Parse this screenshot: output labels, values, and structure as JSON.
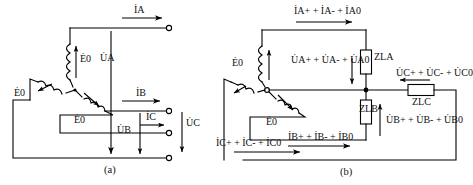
{
  "figure": {
    "type": "circuit-diagram",
    "captions": {
      "left": "(a)",
      "right": "(b)"
    }
  },
  "diagram_a": {
    "caption": "(a)",
    "source": {
      "type": "wye-connected-three-phase-source",
      "coil_count": 3,
      "emf_labels": [
        "Ė0",
        "Ė0",
        "Ė0"
      ]
    },
    "line_currents": [
      {
        "name": "current-a",
        "label": "İA",
        "direction": "right"
      },
      {
        "name": "current-b",
        "label": "İB",
        "direction": "right"
      },
      {
        "name": "current-c",
        "label": "İC",
        "direction": "right"
      }
    ],
    "phase_voltages": [
      {
        "name": "voltage-a",
        "label": "U̇A",
        "direction": "down"
      },
      {
        "name": "voltage-b",
        "label": "U̇B",
        "direction": "down"
      },
      {
        "name": "voltage-c",
        "label": "U̇C",
        "direction": "down"
      }
    ],
    "terminals": 3
  },
  "diagram_b": {
    "caption": "(b)",
    "source": {
      "type": "wye-connected-three-phase-source",
      "coil_count": 3,
      "emf_labels": [
        "Ė0",
        "Ė0",
        "Ė0"
      ]
    },
    "currents": [
      {
        "name": "current-a-components",
        "label": "İA+ + İA- + İA0",
        "direction": "right"
      },
      {
        "name": "current-b-components",
        "label": "İB+ + İB- + İB0",
        "direction": "right"
      },
      {
        "name": "current-c-components",
        "label": "İC+ + İC- + İC0",
        "direction": "right"
      }
    ],
    "voltages": [
      {
        "name": "voltage-a-components",
        "label": "U̇A+ + U̇A- + U̇A0",
        "direction": "down"
      },
      {
        "name": "voltage-b-components",
        "label": "U̇B+ + U̇B- + U̇B0",
        "direction": "up"
      },
      {
        "name": "voltage-c-components",
        "label": "U̇C+ + U̇C- + U̇C0",
        "direction": "left"
      }
    ],
    "impedances": [
      {
        "name": "impedance-la",
        "label": "ZLA",
        "orientation": "vertical"
      },
      {
        "name": "impedance-lb",
        "label": "ZLB",
        "orientation": "vertical"
      },
      {
        "name": "impedance-lc",
        "label": "ZLC",
        "orientation": "horizontal"
      }
    ]
  },
  "style": {
    "line_color": "#000000",
    "background": "#ffffff",
    "stroke_width": 1.1
  }
}
